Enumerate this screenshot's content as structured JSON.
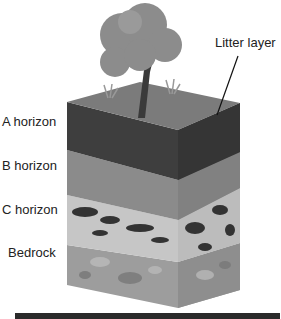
{
  "diagram": {
    "labels": {
      "litter": "Litter layer",
      "a": "A horizon",
      "b": "B horizon",
      "c": "C horizon",
      "bedrock": "Bedrock"
    },
    "colors": {
      "tree_canopy": "#8c8c8c",
      "trunk": "#3a3a3a",
      "litter_top": "#7a7a7a",
      "a_horizon": "#3d3d3d",
      "b_horizon": "#8a8a8a",
      "c_horizon": "#c4c4c4",
      "c_rocks": "#333333",
      "bedrock": "#9c9c9c"
    }
  }
}
